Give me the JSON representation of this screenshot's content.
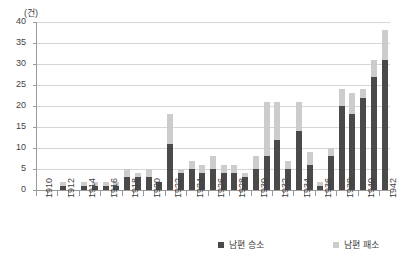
{
  "chart_data": {
    "type": "bar",
    "title": "",
    "subtitle": "",
    "xlabel": "",
    "ylabel": "",
    "yunit": "(건)",
    "stacked": true,
    "grid": true,
    "legend_position": "bottom",
    "ylim": [
      0,
      40
    ],
    "ytick_labels": [
      "0",
      "5",
      "10",
      "15",
      "20",
      "25",
      "30",
      "35",
      "40"
    ],
    "ytick_values": [
      0,
      5,
      10,
      15,
      20,
      25,
      30,
      35,
      40
    ],
    "categories": [
      "1910",
      "1911",
      "1912",
      "1913",
      "1914",
      "1915",
      "1916",
      "1917",
      "1918",
      "1919",
      "1920",
      "1921",
      "1922",
      "1923",
      "1924",
      "1925",
      "1926",
      "1927",
      "1928",
      "1929",
      "1930",
      "1931",
      "1932",
      "1933",
      "1934",
      "1935",
      "1936",
      "1937",
      "1938",
      "1939",
      "1940",
      "1941",
      "1942"
    ],
    "xtick_labels_shown": [
      "1910",
      "1912",
      "1914",
      "1916",
      "1918",
      "1920",
      "1922",
      "1924",
      "1926",
      "1928",
      "1930",
      "1932",
      "1934",
      "1936",
      "1938",
      "1940",
      "1942"
    ],
    "series": [
      {
        "name": "남편 승소",
        "color": "#4a4a4a",
        "values": [
          0,
          0,
          1,
          0,
          1,
          1,
          1,
          1,
          3,
          3,
          3,
          2,
          11,
          4,
          5,
          4,
          5,
          4,
          4,
          3,
          5,
          8,
          12,
          5,
          14,
          6,
          1,
          8,
          20,
          18,
          22,
          27,
          31
        ]
      },
      {
        "name": "남편 패소",
        "color": "#cccccc",
        "values": [
          0,
          0,
          1,
          0,
          1,
          1,
          1,
          1,
          2,
          1,
          2,
          0,
          7,
          1,
          2,
          2,
          3,
          2,
          2,
          1,
          3,
          13,
          9,
          2,
          7,
          3,
          1,
          2,
          4,
          5,
          2,
          4,
          7
        ]
      }
    ],
    "totals": [
      0,
      0,
      2,
      0,
      2,
      2,
      2,
      2,
      5,
      4,
      5,
      2,
      18,
      5,
      7,
      6,
      8,
      6,
      6,
      4,
      8,
      21,
      21,
      7,
      21,
      9,
      2,
      10,
      24,
      23,
      24,
      31,
      38
    ]
  },
  "legend": {
    "entries": [
      {
        "label": "남편 승소",
        "color": "#4a4a4a"
      },
      {
        "label": "남편 패소",
        "color": "#cccccc"
      }
    ]
  }
}
